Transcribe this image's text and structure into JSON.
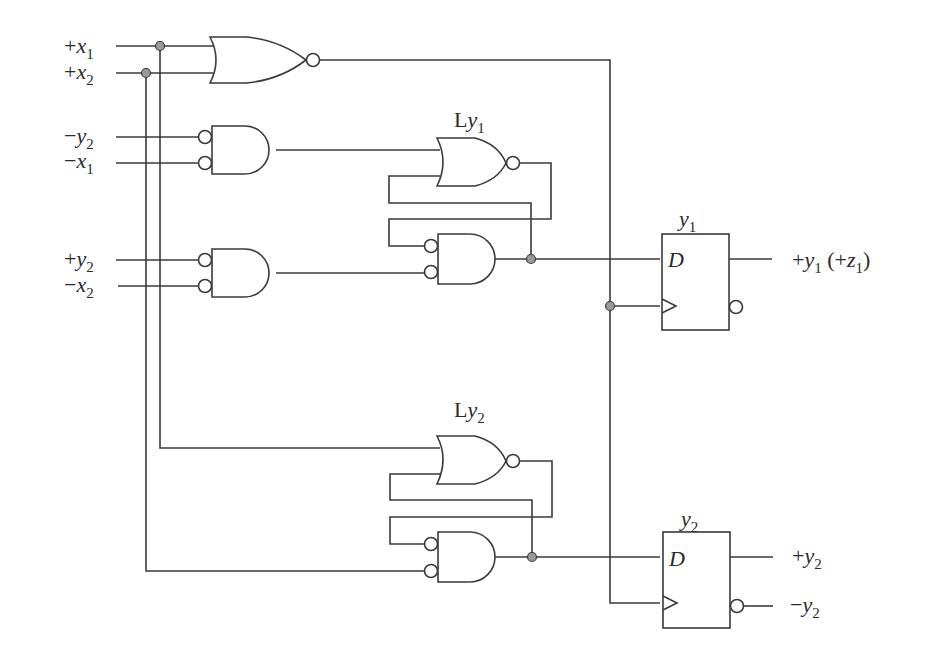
{
  "diagram": {
    "type": "sequential logic circuit",
    "inputs": [
      {
        "id": "in-x1-pos",
        "sign": "+",
        "var": "x",
        "sub": "1"
      },
      {
        "id": "in-x2-pos",
        "sign": "+",
        "var": "x",
        "sub": "2"
      },
      {
        "id": "in-y2-neg",
        "sign": "−",
        "var": "y",
        "sub": "2"
      },
      {
        "id": "in-x1-neg",
        "sign": "−",
        "var": "x",
        "sub": "1"
      },
      {
        "id": "in-y2-pos",
        "sign": "+",
        "var": "y",
        "sub": "2"
      },
      {
        "id": "in-x2-neg",
        "sign": "−",
        "var": "x",
        "sub": "2"
      }
    ],
    "latches": [
      {
        "label_prefix": "L",
        "var": "y",
        "sub": "1"
      },
      {
        "label_prefix": "L",
        "var": "y",
        "sub": "2"
      }
    ],
    "flipflops": [
      {
        "title_var": "y",
        "title_sub": "1",
        "d_label": "D"
      },
      {
        "title_var": "y",
        "title_sub": "2",
        "d_label": "D"
      }
    ],
    "outputs": [
      {
        "sign": "+",
        "var": "y",
        "sub": "1",
        "extra_open": " (+",
        "extra_var": "z",
        "extra_sub": "1",
        "extra_close": ")"
      },
      {
        "sign": "+",
        "var": "y",
        "sub": "2"
      },
      {
        "sign": "−",
        "var": "y",
        "sub": "2"
      }
    ],
    "colors": {
      "wire": "#3a3a3a",
      "junction": "#9a9a9a",
      "background": "#ffffff"
    }
  }
}
